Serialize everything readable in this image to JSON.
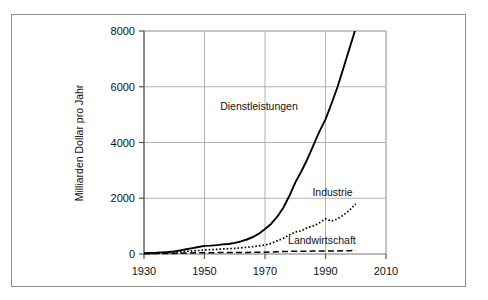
{
  "chart_data": {
    "type": "line",
    "title": "",
    "subtitle": "",
    "xlabel": "",
    "ylabel": "Milliarden Dollar pro Jahr",
    "xlim": [
      1930,
      2010
    ],
    "ylim": [
      0,
      8000
    ],
    "xticks": [
      "1930",
      "1950",
      "1970",
      "1990",
      "2010"
    ],
    "xtick_values": [
      1930,
      1950,
      1970,
      1990,
      2010
    ],
    "yticks": [
      "0",
      "2000",
      "4000",
      "6000",
      "8000"
    ],
    "ytick_values": [
      0,
      2000,
      4000,
      6000,
      8000
    ],
    "grid": true,
    "legend_position": "inline-annotations",
    "x": [
      1930,
      1932,
      1934,
      1936,
      1938,
      1940,
      1942,
      1944,
      1946,
      1948,
      1950,
      1952,
      1954,
      1956,
      1958,
      1960,
      1962,
      1964,
      1966,
      1968,
      1970,
      1972,
      1974,
      1976,
      1978,
      1980,
      1982,
      1984,
      1986,
      1988,
      1990,
      1992,
      1994,
      1996,
      1998,
      2000
    ],
    "series": [
      {
        "name": "Dienstleistungen",
        "style": "solid",
        "color": "#000000",
        "label_x": 1968,
        "label_y": 5150,
        "values": [
          30,
          35,
          45,
          60,
          70,
          90,
          130,
          170,
          210,
          250,
          290,
          300,
          320,
          345,
          360,
          400,
          450,
          520,
          610,
          730,
          900,
          1080,
          1330,
          1650,
          2070,
          2560,
          2960,
          3400,
          3900,
          4400,
          4830,
          5400,
          6000,
          6700,
          7400,
          8100
        ]
      },
      {
        "name": "Industrie",
        "style": "dotted",
        "color": "#000000",
        "label_x": 1999,
        "label_y": 2080,
        "values": [
          20,
          22,
          28,
          36,
          42,
          55,
          78,
          95,
          110,
          125,
          145,
          155,
          165,
          180,
          190,
          205,
          220,
          240,
          265,
          290,
          320,
          380,
          470,
          560,
          680,
          790,
          830,
          950,
          1010,
          1120,
          1260,
          1180,
          1260,
          1400,
          1580,
          1800
        ]
      },
      {
        "name": "Landwirtschaft",
        "style": "dashed",
        "color": "#000000",
        "label_x": 2000,
        "label_y": 360,
        "values": [
          12,
          12,
          14,
          16,
          18,
          22,
          30,
          36,
          40,
          44,
          48,
          48,
          50,
          52,
          52,
          55,
          56,
          58,
          60,
          63,
          66,
          72,
          82,
          88,
          95,
          102,
          100,
          102,
          104,
          108,
          112,
          110,
          112,
          116,
          120,
          124
        ]
      }
    ]
  },
  "figure": {
    "frame_color": "#8e8e8e",
    "grid_color": "#aaaaaa",
    "axis_color": "#555555",
    "background": "#ffffff"
  }
}
